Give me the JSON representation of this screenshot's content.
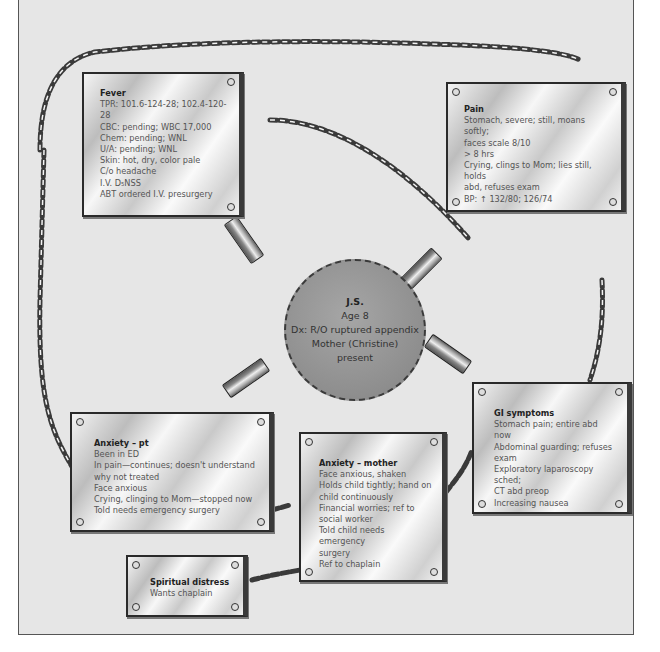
{
  "diagram": {
    "type": "concept-map",
    "center": {
      "name": "J.S.",
      "lines": [
        "Age 8",
        "Dx: R/O ruptured appendix",
        "Mother (Christine)",
        "present"
      ]
    },
    "nodes": [
      {
        "id": "fever",
        "title": "Fever",
        "lines": [
          "TPR: 101.6-124-28; 102.4-120-28",
          "CBC: pending; WBC 17,000",
          "Chem: pending; WNL",
          "U/A: pending; WNL",
          "Skin: hot, dry, color pale",
          "C/o headache",
          "I.V. D₅NSS",
          "ABT ordered I.V. presurgery"
        ]
      },
      {
        "id": "pain",
        "title": "Pain",
        "lines": [
          "Stomach, severe; still, moans softly;",
          "faces scale 8/10",
          "> 8 hrs",
          "Crying, clings to Mom; lies still, holds",
          "abd, refuses exam",
          "BP: ↑ 132/80; 126/74"
        ]
      },
      {
        "id": "gi-symptoms",
        "title": "GI symptoms",
        "lines": [
          "Stomach pain; entire abd now",
          "Abdominal guarding; refuses",
          "exam",
          "Exploratory laparoscopy sched;",
          "CT abd preop",
          "Increasing nausea"
        ]
      },
      {
        "id": "anxiety-pt",
        "title": "Anxiety – pt",
        "lines": [
          "Been in ED",
          "In pain—continues; doesn't understand",
          "why not treated",
          "Face anxious",
          "Crying, clinging to Mom—stopped now",
          "Told needs emergency surgery"
        ]
      },
      {
        "id": "anxiety-mother",
        "title": "Anxiety – mother",
        "lines": [
          "Face anxious, shaken",
          "Holds child tightly; hand on",
          "child continuously",
          "Financial worries; ref to",
          "social worker",
          "Told child needs emergency",
          "surgery",
          "Ref to chaplain"
        ]
      },
      {
        "id": "spiritual-distress",
        "title": "Spiritual distress",
        "lines": [
          "Wants chaplain"
        ]
      }
    ],
    "links": [
      {
        "from": "center",
        "to": "fever",
        "style": "clip"
      },
      {
        "from": "center",
        "to": "pain",
        "style": "clip+chain"
      },
      {
        "from": "center",
        "to": "gi-symptoms",
        "style": "clip"
      },
      {
        "from": "center",
        "to": "anxiety-pt",
        "style": "clip"
      },
      {
        "from": "fever",
        "to": "pain",
        "style": "chain"
      },
      {
        "from": "fever",
        "to": "anxiety-pt",
        "style": "chain"
      },
      {
        "from": "pain",
        "to": "gi-symptoms",
        "style": "chain"
      },
      {
        "from": "anxiety-pt",
        "to": "anxiety-mother",
        "style": "chain"
      },
      {
        "from": "anxiety-mother",
        "to": "spiritual-distress",
        "style": "chain"
      },
      {
        "from": "anxiety-mother",
        "to": "gi-symptoms",
        "style": "chain"
      }
    ]
  }
}
